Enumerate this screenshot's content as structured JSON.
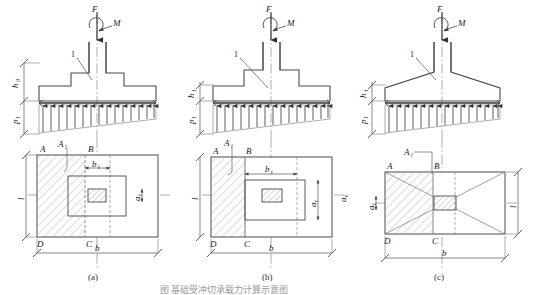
{
  "figure": {
    "caption_a": "(a)",
    "caption_b": "(b)",
    "caption_c": "(c)",
    "title": "图 基础受冲切承载力计算示意图",
    "colors": {
      "line": "#4a4a4a",
      "thin": "#8a8a8a",
      "hatch": "#9a9a9a",
      "center": "#7a7a7a",
      "text": "#222222"
    }
  },
  "panels": [
    {
      "id": "a",
      "caption": "(a)",
      "type": "stepped-foundation-two-step",
      "elevation": {
        "load_force": "F",
        "load_moment": "M",
        "leader_number": "1",
        "depth_label": "h",
        "depth_sub": "0",
        "pressure_label": "p",
        "pressure_sub": "1"
      },
      "plan": {
        "corner_A": "A",
        "corner_B": "B",
        "corner_C": "C",
        "corner_D": "D",
        "area_label": "A",
        "area_sub": "l",
        "width_label": "b",
        "length_label": "l",
        "inner_width_label": "b",
        "inner_width_sub": "t",
        "inner_depth_label": "a",
        "inner_depth_sub": "t"
      }
    },
    {
      "id": "b",
      "caption": "(b)",
      "type": "stepped-foundation-one-step",
      "elevation": {
        "load_force": "F",
        "load_moment": "M",
        "leader_number": "1",
        "depth_label": "h",
        "depth_sub": "1",
        "pressure_label": "p",
        "pressure_sub": "1"
      },
      "plan": {
        "corner_A": "A",
        "corner_B": "B",
        "corner_C": "C",
        "corner_D": "D",
        "area_label": "A",
        "area_sub": "l",
        "width_label": "b",
        "length_label": "l",
        "inner_width_label": "b",
        "inner_width_sub": "t",
        "inner_depth_label": "a",
        "inner_depth_sub": "t",
        "outer_depth_label": "a",
        "outer_depth_sub": "t"
      }
    },
    {
      "id": "c",
      "caption": "(c)",
      "type": "tapered-foundation",
      "elevation": {
        "load_force": "F",
        "load_moment": "M",
        "leader_number": "1",
        "depth_label": "h",
        "depth_sub": "1",
        "pressure_label": "p",
        "pressure_sub": "1"
      },
      "plan": {
        "corner_A": "A",
        "corner_B": "B",
        "corner_C": "C",
        "corner_D": "D",
        "area_label": "A",
        "area_sub": "l",
        "width_label": "b",
        "length_label": "l",
        "inner_depth_label": "a",
        "inner_depth_sub": "t"
      }
    }
  ]
}
